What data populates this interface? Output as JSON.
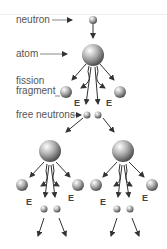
{
  "labels": {
    "neutron": "neutron",
    "atom": "atom",
    "fission_fragment_1": "fission",
    "fission_fragment_2": "fragment",
    "free_neutrons": "free neutrons"
  },
  "energy_label": "E",
  "colors": {
    "arrow": "#333333",
    "sphere_light": "#ffffff",
    "sphere_dark": "#555555",
    "text": "#555555"
  }
}
